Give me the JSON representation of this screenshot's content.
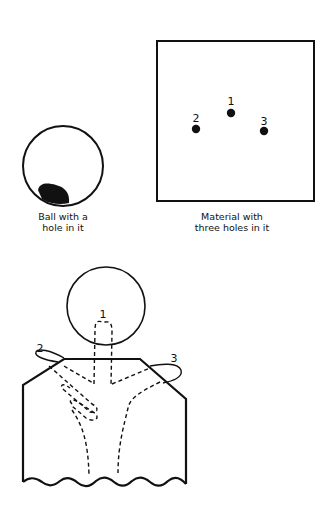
{
  "figure": {
    "ball": {
      "caption_line1": "Ball with a",
      "caption_line2": "hole in it"
    },
    "material": {
      "caption_line1": "Material with",
      "caption_line2": "three holes in it",
      "holes": [
        {
          "label": "1"
        },
        {
          "label": "2"
        },
        {
          "label": "3"
        }
      ]
    },
    "assembly": {
      "thread_labels": [
        {
          "label": "1"
        },
        {
          "label": "2"
        },
        {
          "label": "3"
        }
      ]
    },
    "colors": {
      "ink": "#111111",
      "background": "#ffffff"
    }
  }
}
